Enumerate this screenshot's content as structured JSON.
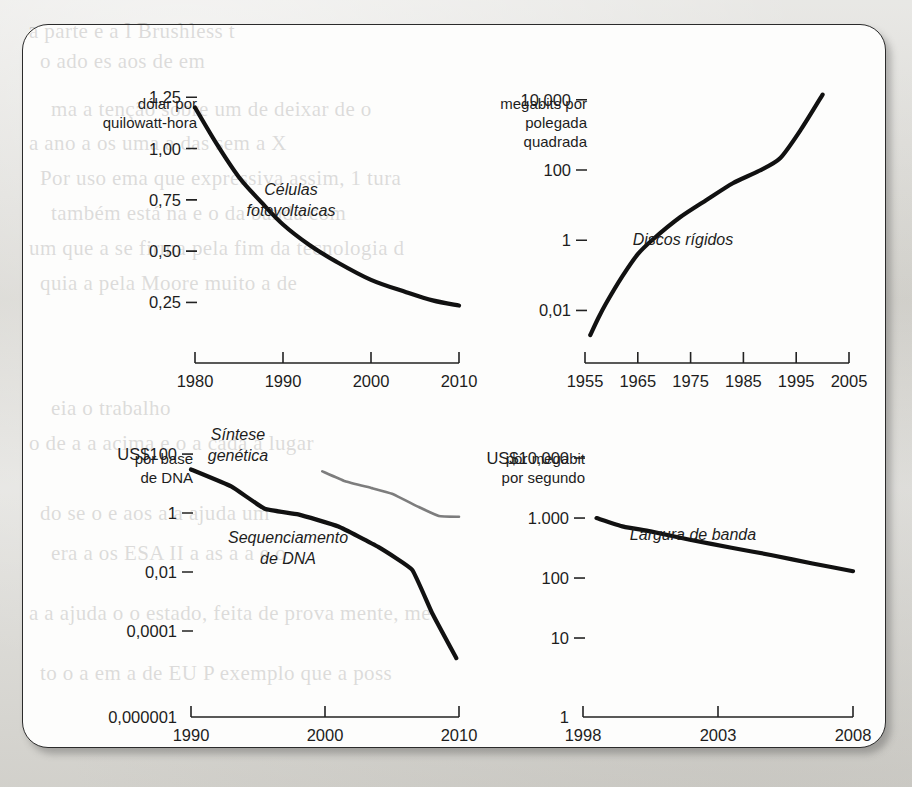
{
  "page": {
    "background_color": "#d6d5d0",
    "panel_color": "#fdfdfc",
    "ink_color": "#111111",
    "accent_gray": "#7d7d7d"
  },
  "bleed_through_text": [
    "a parte e a I Brushless t",
    "o       ado    es aos  de    em",
    "ma  a tenção  sobre um  de deixar de o",
    "a   ano   a   os uma  a  das sem  a   X",
    "Por   uso  ema  que  expressiva  assim,  1  tura",
    "também está  na  e o   da  banda  com",
    "um   que  a  se  firma  pela  fim  da  tecnologia  d",
    "quia   a   pela   Moore   muito   a   de",
    "eia  o  trabalho",
    "o  de   a  a  acima  e  o  a  cada  a  lugar",
    "do    se  o  e    aos  a  a  ajuda  um",
    "era  a  os  ESA  II  a  as  a  a  e  o",
    "a  a  ajuda  o  o  estado,  feita  de  prova  mente,  me",
    "to  o  a  em  a  de  EU  P  exemplo  que  a  poss"
  ],
  "chart_data": [
    {
      "id": "photovoltaic-cells",
      "type": "line",
      "title": "",
      "series_label": "Células fotovoltaicas",
      "unit_label_lines": [
        "dólar por",
        "quilowatt-hora"
      ],
      "ylabel": "dólar por quilowatt-hora",
      "xlabel": "",
      "yscale": "linear",
      "yticks": [
        "1,25",
        "1,00",
        "0,75",
        "0,50",
        "0,25"
      ],
      "ytick_values": [
        1.25,
        1.0,
        0.75,
        0.5,
        0.25
      ],
      "xticks": [
        "1980",
        "1990",
        "2000",
        "2010"
      ],
      "xtick_values": [
        1980,
        1990,
        2000,
        2010
      ],
      "xlim": [
        1980,
        2010
      ],
      "ylim": [
        0.14,
        1.3
      ],
      "grid": false,
      "legend": "inline",
      "points": [
        {
          "x": 1980.0,
          "y": 1.2
        },
        {
          "x": 1982.5,
          "y": 1.02
        },
        {
          "x": 1985.0,
          "y": 0.86
        },
        {
          "x": 1987.5,
          "y": 0.74
        },
        {
          "x": 1990.0,
          "y": 0.63
        },
        {
          "x": 1993.0,
          "y": 0.53
        },
        {
          "x": 1996.0,
          "y": 0.45
        },
        {
          "x": 2000.0,
          "y": 0.36
        },
        {
          "x": 2004.0,
          "y": 0.3
        },
        {
          "x": 2007.0,
          "y": 0.26
        },
        {
          "x": 2010.0,
          "y": 0.235
        }
      ]
    },
    {
      "id": "hard-disks",
      "type": "line",
      "title": "",
      "series_label": "Discos rígidos",
      "unit_label_lines": [
        "megabits por",
        "polegada",
        "quadrada"
      ],
      "ylabel": "megabits por polegada quadrada",
      "xlabel": "",
      "yscale": "log",
      "yticks": [
        "10.000",
        "100",
        "1",
        "0,01"
      ],
      "ytick_values": [
        10000,
        100,
        1,
        0.01
      ],
      "xticks": [
        "1955",
        "1965",
        "1975",
        "1985",
        "1995",
        "2005"
      ],
      "xtick_values": [
        1955,
        1965,
        1975,
        1985,
        1995,
        2005
      ],
      "xlim": [
        1955,
        2005
      ],
      "ylim": [
        0.002,
        30000
      ],
      "grid": false,
      "legend": "inline",
      "points": [
        {
          "x": 1956.0,
          "y": 0.002
        },
        {
          "x": 1957.5,
          "y": 0.006
        },
        {
          "x": 1959.0,
          "y": 0.016
        },
        {
          "x": 1962.0,
          "y": 0.09
        },
        {
          "x": 1965.0,
          "y": 0.4
        },
        {
          "x": 1968.0,
          "y": 1.1
        },
        {
          "x": 1973.0,
          "y": 4.5
        },
        {
          "x": 1978.0,
          "y": 14
        },
        {
          "x": 1983.0,
          "y": 42
        },
        {
          "x": 1988.0,
          "y": 95
        },
        {
          "x": 1992.0,
          "y": 220
        },
        {
          "x": 1996.0,
          "y": 1500
        },
        {
          "x": 2000.0,
          "y": 14000
        }
      ]
    },
    {
      "id": "dna-cost",
      "type": "line",
      "title": "",
      "unit_label_lines": [
        "por base",
        "de DNA"
      ],
      "ylabel": "US$ por base de DNA",
      "xlabel": "",
      "yscale": "log",
      "yticks": [
        "US$100",
        "1",
        "0,01",
        "0,0001",
        "0,000001"
      ],
      "ytick_values": [
        100,
        1,
        0.01,
        0.0001,
        1e-06
      ],
      "xticks": [
        "1990",
        "2000",
        "2010"
      ],
      "xtick_values": [
        1990,
        2000,
        2010
      ],
      "xlim": [
        1990,
        2010
      ],
      "ylim": [
        1e-06,
        300
      ],
      "grid": false,
      "legend": "inline",
      "series": [
        {
          "name": "Sequenciamento de DNA",
          "color": "#111111",
          "points": [
            {
              "x": 1990.0,
              "y": 30
            },
            {
              "x": 1993.0,
              "y": 8
            },
            {
              "x": 1995.5,
              "y": 1.4
            },
            {
              "x": 1998.0,
              "y": 0.9
            },
            {
              "x": 2001.0,
              "y": 0.35
            },
            {
              "x": 2004.0,
              "y": 0.07
            },
            {
              "x": 2006.5,
              "y": 0.012
            },
            {
              "x": 2008.0,
              "y": 0.0004
            },
            {
              "x": 2009.8,
              "y": 1.2e-05
            }
          ]
        },
        {
          "name": "Síntese genética",
          "color": "#7d7d7d",
          "points": [
            {
              "x": 1999.8,
              "y": 26
            },
            {
              "x": 2001.5,
              "y": 12
            },
            {
              "x": 2003.5,
              "y": 7
            },
            {
              "x": 2005.0,
              "y": 4.5
            },
            {
              "x": 2007.0,
              "y": 1.6
            },
            {
              "x": 2008.5,
              "y": 0.8
            },
            {
              "x": 2010.0,
              "y": 0.75
            }
          ]
        }
      ],
      "series_labels": [
        {
          "text_lines": [
            "Síntese",
            "genética"
          ],
          "color": "#1d1d1d"
        },
        {
          "text_lines": [
            "Sequenciamento",
            "de DNA"
          ],
          "color": "#1d1d1d"
        }
      ]
    },
    {
      "id": "bandwidth-cost",
      "type": "line",
      "title": "",
      "series_label": "Largura de banda",
      "unit_label_lines": [
        "por megabit",
        "por segundo"
      ],
      "ylabel": "US$ por megabit por segundo",
      "xlabel": "",
      "yscale": "log",
      "yticks": [
        "US$10,000",
        "1.000",
        "100",
        "10",
        "1"
      ],
      "ytick_values": [
        10000,
        1000,
        100,
        10,
        1
      ],
      "xticks": [
        "1998",
        "2003",
        "2008"
      ],
      "xtick_values": [
        1998,
        2003,
        2008
      ],
      "xlim": [
        1998,
        2008
      ],
      "ylim": [
        1,
        20000
      ],
      "grid": false,
      "legend": "inline",
      "points": [
        {
          "x": 1998.5,
          "y": 1000
        },
        {
          "x": 1999.5,
          "y": 720
        },
        {
          "x": 2000.5,
          "y": 600
        },
        {
          "x": 2002.0,
          "y": 430
        },
        {
          "x": 2003.5,
          "y": 320
        },
        {
          "x": 2005.0,
          "y": 240
        },
        {
          "x": 2006.5,
          "y": 175
        },
        {
          "x": 2008.0,
          "y": 130
        }
      ]
    }
  ]
}
